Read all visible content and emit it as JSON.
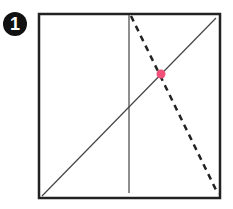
{
  "step": {
    "number": "1"
  },
  "diagram": {
    "square": {
      "x": 39,
      "y": 14,
      "w": 181,
      "h": 184
    },
    "colors": {
      "line": "#444444",
      "dot": "#f0507a",
      "frame": "#222222"
    },
    "vertical_crease": {
      "x": 129
    },
    "diagonal": {
      "from": [
        42,
        196
      ],
      "to": [
        216,
        18
      ]
    },
    "dashed_fold": {
      "from": [
        131,
        16
      ],
      "to": [
        218,
        194
      ]
    },
    "point": {
      "x": 161,
      "y": 74
    }
  }
}
